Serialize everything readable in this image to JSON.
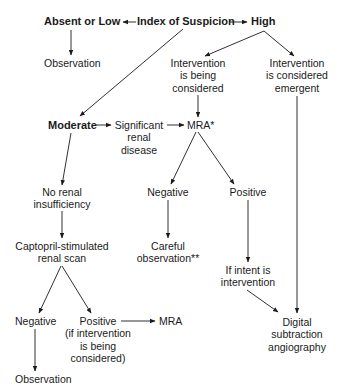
{
  "diagram": {
    "type": "flowchart",
    "nodes": {
      "absent_low": {
        "lines": [
          "Absent or Low"
        ]
      },
      "index": {
        "lines": [
          "Index of Suspicion"
        ]
      },
      "high": {
        "lines": [
          "High"
        ]
      },
      "obs_top": {
        "lines": [
          "Observation"
        ]
      },
      "interv_considered": {
        "lines": [
          "Intervention",
          "is being",
          "considered"
        ]
      },
      "interv_emergent": {
        "lines": [
          "Intervention",
          "is considered",
          "emergent"
        ]
      },
      "moderate": {
        "lines": [
          "Moderate"
        ]
      },
      "significant": {
        "lines": [
          "Significant",
          "renal",
          "disease"
        ]
      },
      "mra_star": {
        "lines": [
          "MRA*"
        ]
      },
      "no_renal": {
        "lines": [
          "No renal",
          "insufficiency"
        ]
      },
      "negative_mra": {
        "lines": [
          "Negative"
        ]
      },
      "positive_mra": {
        "lines": [
          "Positive"
        ]
      },
      "captopril": {
        "lines": [
          "Captopril-stimulated",
          "renal scan"
        ]
      },
      "careful": {
        "lines": [
          "Careful",
          "observation**"
        ]
      },
      "if_intent": {
        "lines": [
          "If intent is",
          "intervention"
        ]
      },
      "negative_scan": {
        "lines": [
          "Negative"
        ]
      },
      "positive_scan": {
        "lines": [
          "Positive",
          "(if intervention",
          "is being",
          "considered)"
        ]
      },
      "mra_bottom": {
        "lines": [
          "MRA"
        ]
      },
      "dsa": {
        "lines": [
          "Digital",
          "subtraction",
          "angiography"
        ]
      },
      "obs_bottom": {
        "lines": [
          "Observation"
        ]
      }
    },
    "edges": [
      [
        "index",
        "absent_low"
      ],
      [
        "index",
        "high"
      ],
      [
        "index",
        "moderate"
      ],
      [
        "absent_low",
        "obs_top"
      ],
      [
        "high",
        "interv_considered"
      ],
      [
        "high",
        "interv_emergent"
      ],
      [
        "interv_considered",
        "mra_star"
      ],
      [
        "interv_emergent",
        "dsa"
      ],
      [
        "moderate",
        "significant"
      ],
      [
        "significant",
        "mra_star"
      ],
      [
        "moderate",
        "no_renal"
      ],
      [
        "mra_star",
        "negative_mra"
      ],
      [
        "mra_star",
        "positive_mra"
      ],
      [
        "negative_mra",
        "careful"
      ],
      [
        "positive_mra",
        "if_intent"
      ],
      [
        "if_intent",
        "dsa"
      ],
      [
        "no_renal",
        "captopril"
      ],
      [
        "captopril",
        "negative_scan"
      ],
      [
        "captopril",
        "positive_scan"
      ],
      [
        "positive_scan",
        "mra_bottom"
      ],
      [
        "negative_scan",
        "obs_bottom"
      ]
    ],
    "line_color": "#1a1a1a"
  }
}
